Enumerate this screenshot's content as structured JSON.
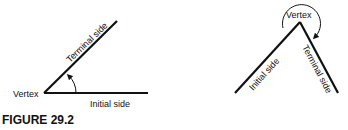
{
  "figure": {
    "caption": "FIGURE 29.2",
    "left": {
      "vertex_label": "Vertex",
      "initial_label": "Initial side",
      "terminal_label": "Terminal side"
    },
    "right": {
      "vertex_label": "Vertex",
      "initial_label": "Initial side",
      "terminal_label": "Terminal side"
    }
  }
}
